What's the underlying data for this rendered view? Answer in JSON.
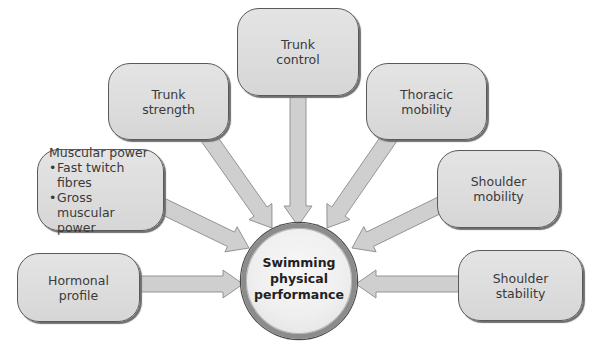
{
  "diagram": {
    "type": "concept-map",
    "center": {
      "label": "Swimming\nphysical\nperformance"
    },
    "nodes": [
      {
        "id": "trunk-control",
        "label": "Trunk\ncontrol"
      },
      {
        "id": "trunk-strength",
        "label": "Trunk\nstrength"
      },
      {
        "id": "thoracic-mobility",
        "label": "Thoracic\nmobility"
      },
      {
        "id": "muscular-power",
        "title": "Muscular power",
        "bullets": [
          "Fast twitch fibres",
          "Gross muscular power"
        ]
      },
      {
        "id": "shoulder-mobility",
        "label": "Shoulder\nmobility"
      },
      {
        "id": "hormonal-profile",
        "label": "Hormonal\nprofile"
      },
      {
        "id": "shoulder-stability",
        "label": "Shoulder\nstability"
      }
    ],
    "edges": [
      {
        "from": "trunk-control",
        "to": "center"
      },
      {
        "from": "trunk-strength",
        "to": "center"
      },
      {
        "from": "thoracic-mobility",
        "to": "center"
      },
      {
        "from": "muscular-power",
        "to": "center"
      },
      {
        "from": "shoulder-mobility",
        "to": "center"
      },
      {
        "from": "hormonal-profile",
        "to": "center"
      },
      {
        "from": "shoulder-stability",
        "to": "center"
      }
    ],
    "colors": {
      "box_fill": "#dedede",
      "box_border": "#5a5a5a",
      "arrow_fill": "#cfcfcf",
      "arrow_stroke": "#8a8a8a",
      "circle_ring": "#8c8c8c",
      "text": "#3a3a3a"
    }
  }
}
